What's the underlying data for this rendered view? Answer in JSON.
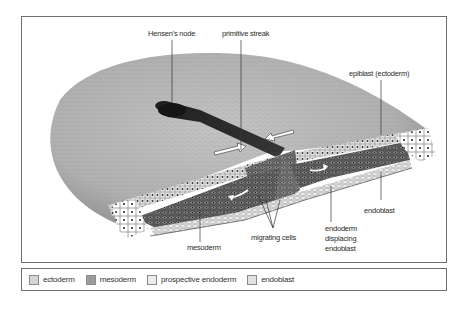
{
  "figure": {
    "type": "diagram"
  },
  "labels": {
    "hensens_node": "Hensen's node",
    "primitive_streak": "primitive streak",
    "epiblast": "epiblast (ectoderm)",
    "endoblast": "endoblast",
    "endoderm_line1": "endoderm",
    "endoderm_line2": "displacing",
    "endoderm_line3": "endoblast",
    "migrating_cells": "migrating cells",
    "mesoderm": "mesoderm"
  },
  "legend": {
    "items": [
      {
        "label": "ectoderm",
        "color": "#d6d6d6"
      },
      {
        "label": "mesoderm",
        "color": "#9c9c9c"
      },
      {
        "label": "prospective endoderm",
        "color": "#ececec"
      },
      {
        "label": "endoblast",
        "color": "#e2e2e2"
      }
    ]
  },
  "colors": {
    "frame_border": "#6e6e6e",
    "surface": "#b8b8b8",
    "streak": "#1e1e1e",
    "mesoderm_fill": "#3a3a3a"
  }
}
